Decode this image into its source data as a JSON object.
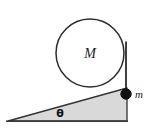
{
  "figure": {
    "background_color": "#ffffff",
    "stroke_color": "#262626",
    "incline_fill": "#d9d9d9",
    "circle_fill": "#ffffff",
    "ball_fill": "#111111",
    "labels": {
      "cylinder": "M",
      "hanging_mass": "m",
      "angle": "θ"
    },
    "geometry": {
      "circle": {
        "cx": 90,
        "cy": 53,
        "r": 34
      },
      "incline": {
        "apex_x": 8,
        "apex_y": 121,
        "base_right_x": 127,
        "base_y": 121,
        "top_right_y": 88
      },
      "cord": {
        "x": 126,
        "y_top": 42,
        "y_bottom": 93
      },
      "ball": {
        "cx": 126,
        "cy": 94,
        "r": 5
      }
    }
  }
}
